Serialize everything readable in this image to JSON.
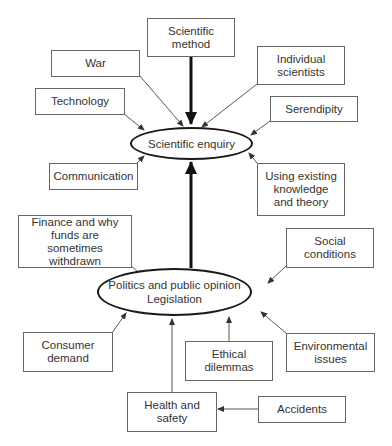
{
  "diagram": {
    "type": "influence-diagram",
    "central_nodes": {
      "scientific_enquiry": {
        "label": "Scientific enquiry"
      },
      "politics": {
        "line1": "Politics and public opinion",
        "line2": "Legislation"
      }
    },
    "nodes": {
      "scientific_method": {
        "label": "Scientific method"
      },
      "war": {
        "label": "War"
      },
      "individual_scientists": {
        "label": "Individual scientists"
      },
      "technology": {
        "label": "Technology"
      },
      "serendipity": {
        "label": "Serendipity"
      },
      "communication": {
        "label": "Communication"
      },
      "existing_knowledge": {
        "label": "Using existing knowledge and theory"
      },
      "finance": {
        "label": "Finance and why funds are sometimes withdrawn"
      },
      "social_conditions": {
        "label": "Social conditions"
      },
      "consumer_demand": {
        "label": "Consumer demand"
      },
      "ethical_dilemmas": {
        "label": "Ethical dilemmas"
      },
      "environmental_issues": {
        "label": "Environmental issues"
      },
      "health_safety": {
        "label": "Health and safety"
      },
      "accidents": {
        "label": "Accidents"
      }
    },
    "edges": [
      {
        "from": "Scientific method",
        "to": "Scientific enquiry",
        "weight": "thick"
      },
      {
        "from": "War",
        "to": "Scientific enquiry",
        "weight": "thin"
      },
      {
        "from": "Individual scientists",
        "to": "Scientific enquiry",
        "weight": "thin"
      },
      {
        "from": "Technology",
        "to": "Scientific enquiry",
        "weight": "thin"
      },
      {
        "from": "Serendipity",
        "to": "Scientific enquiry",
        "weight": "thin"
      },
      {
        "from": "Communication",
        "to": "Scientific enquiry",
        "weight": "thin"
      },
      {
        "from": "Using existing knowledge and theory",
        "to": "Scientific enquiry",
        "weight": "thin"
      },
      {
        "from": "Politics and public opinion / Legislation",
        "to": "Scientific enquiry",
        "weight": "thick"
      },
      {
        "from": "Finance and why funds are sometimes withdrawn",
        "to": "Politics and public opinion / Legislation",
        "weight": "thin"
      },
      {
        "from": "Social conditions",
        "to": "Politics and public opinion / Legislation",
        "weight": "thin"
      },
      {
        "from": "Consumer demand",
        "to": "Politics and public opinion / Legislation",
        "weight": "thin"
      },
      {
        "from": "Ethical dilemmas",
        "to": "Politics and public opinion / Legislation",
        "weight": "thin"
      },
      {
        "from": "Environmental issues",
        "to": "Politics and public opinion / Legislation",
        "weight": "thin"
      },
      {
        "from": "Health and safety",
        "to": "Politics and public opinion / Legislation",
        "weight": "thin"
      },
      {
        "from": "Accidents",
        "to": "Health and safety",
        "weight": "thin"
      }
    ],
    "colors": {
      "line": "#333333",
      "thick_line": "#111111",
      "box_border": "#666666",
      "background": "#ffffff"
    }
  }
}
